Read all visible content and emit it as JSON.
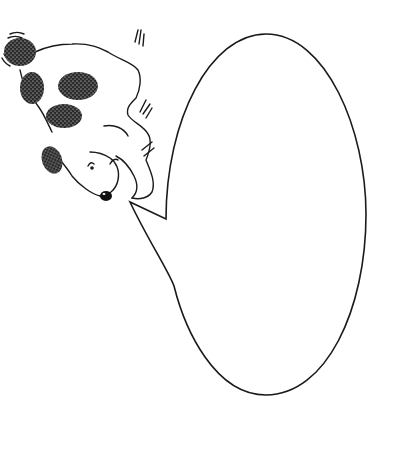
{
  "illustration": {
    "subject": "dog",
    "description": "Black-and-white line drawing of a fluffy spotted dog lying diagonally with a large empty speech bubble",
    "colors": {
      "background": "#ffffff",
      "line": "#1a1a1a",
      "spots": "#2b2b2b"
    }
  },
  "speech_bubble": {
    "text": "",
    "shape": "ellipse-with-tail",
    "tail_direction": "left-toward-dog-nose"
  }
}
